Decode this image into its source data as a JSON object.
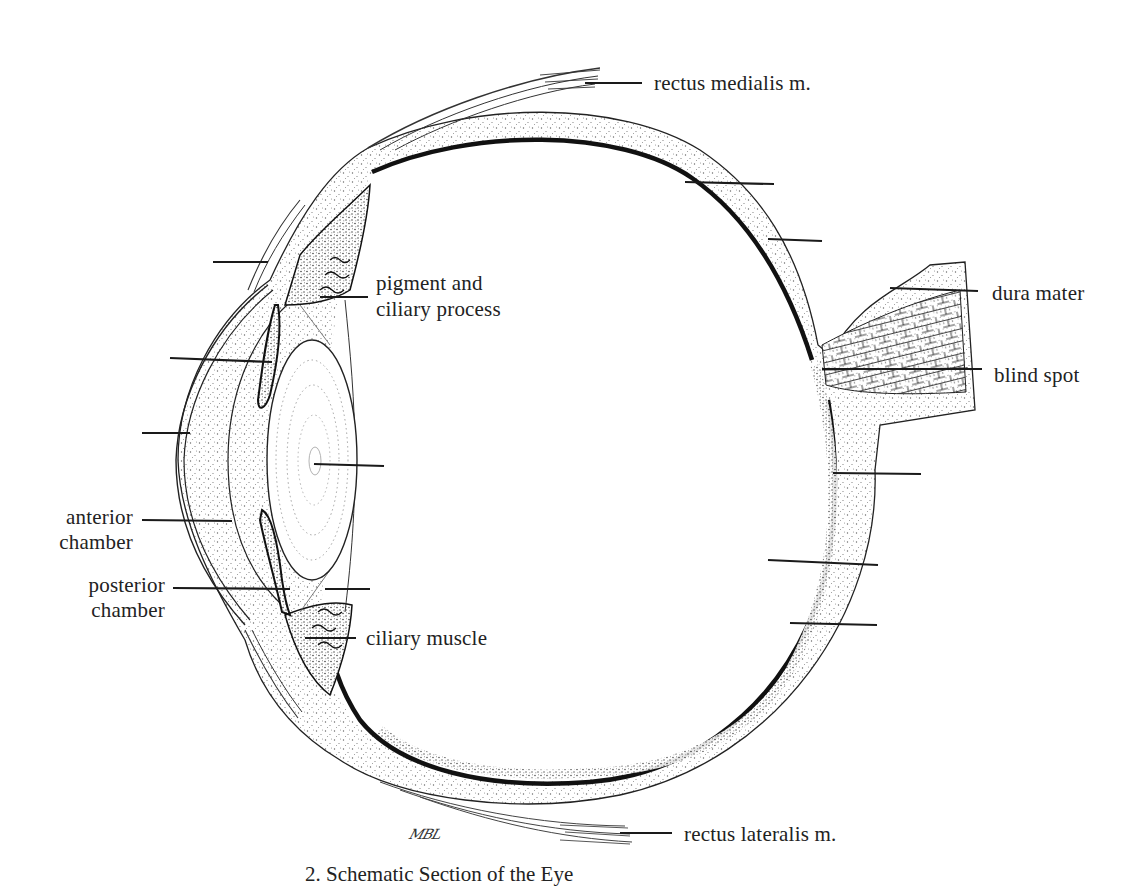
{
  "figure": {
    "caption": "2. Schematic Section of the Eye",
    "signature": "MBL",
    "colors": {
      "ink": "#1a1a1a",
      "stipple": "#555555",
      "background": "#ffffff",
      "choroid": "#111111"
    }
  },
  "labels": {
    "rectus_medialis": "rectus medialis m.",
    "pigment_line1": "pigment and",
    "pigment_line2": "ciliary process",
    "dura_mater": "dura mater",
    "blind_spot": "blind spot",
    "anterior_line1": "anterior",
    "anterior_line2": "chamber",
    "posterior_line1": "posterior",
    "posterior_line2": "chamber",
    "ciliary_muscle": "ciliary muscle",
    "rectus_lateralis": "rectus lateralis m."
  },
  "unlabeled_leaders": [
    {
      "target": "conjunctiva",
      "x1": 213,
      "y1": 262,
      "x2": 268,
      "y2": 262
    },
    {
      "target": "iris",
      "x1": 170,
      "y1": 358,
      "x2": 272,
      "y2": 362
    },
    {
      "target": "cornea",
      "x1": 142,
      "y1": 433,
      "x2": 190,
      "y2": 433
    },
    {
      "target": "lens",
      "x1": 314,
      "y1": 464,
      "x2": 384,
      "y2": 466
    },
    {
      "target": "suspensory-ligament",
      "x1": 325,
      "y1": 589,
      "x2": 370,
      "y2": 589
    },
    {
      "target": "sclera-upper",
      "x1": 685,
      "y1": 182,
      "x2": 774,
      "y2": 184
    },
    {
      "target": "choroid-upper",
      "x1": 768,
      "y1": 239,
      "x2": 822,
      "y2": 241
    },
    {
      "target": "fovea",
      "x1": 833,
      "y1": 473,
      "x2": 921,
      "y2": 474
    },
    {
      "target": "retina",
      "x1": 768,
      "y1": 560,
      "x2": 878,
      "y2": 565
    },
    {
      "target": "sclera-lower",
      "x1": 790,
      "y1": 623,
      "x2": 877,
      "y2": 625
    }
  ]
}
